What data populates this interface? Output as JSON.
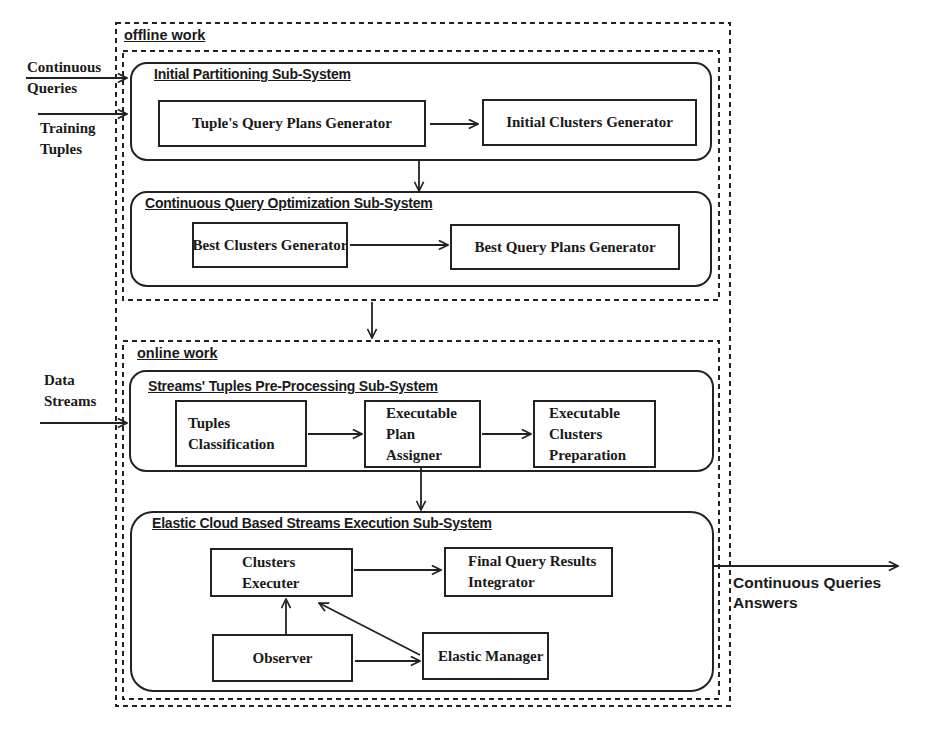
{
  "diagram": {
    "sections": {
      "offline": {
        "label": "offline work"
      },
      "online": {
        "label": "online work"
      }
    },
    "inputs": {
      "continuous_queries": [
        "Continuous",
        "Queries"
      ],
      "training_tuples": [
        "Training",
        "Tuples"
      ],
      "data_streams": [
        "Data",
        "Streams"
      ]
    },
    "output": {
      "lines": [
        "Continuous Queries",
        "Answers"
      ]
    },
    "subsystems": [
      {
        "id": "initial-partitioning",
        "title": "Initial Partitioning Sub-System",
        "components": [
          {
            "id": "tuples-query-plans-generator",
            "lines": [
              "Tuple's Query Plans Generator"
            ]
          },
          {
            "id": "initial-clusters-generator",
            "lines": [
              "Initial Clusters Generator"
            ]
          }
        ]
      },
      {
        "id": "continuous-query-optimization",
        "title": "Continuous Query Optimization Sub-System",
        "components": [
          {
            "id": "best-clusters-generator",
            "lines": [
              "Best Clusters Generator"
            ]
          },
          {
            "id": "best-query-plans-generator",
            "lines": [
              "Best Query Plans Generator"
            ]
          }
        ]
      },
      {
        "id": "streams-preprocessing",
        "title": "Streams' Tuples Pre-Processing Sub-System",
        "components": [
          {
            "id": "tuples-classification",
            "lines": [
              "Tuples",
              "Classification"
            ]
          },
          {
            "id": "executable-plan-assigner",
            "lines": [
              "Executable",
              "Plan",
              "Assigner"
            ]
          },
          {
            "id": "executable-clusters-preparation",
            "lines": [
              "Executable",
              "Clusters",
              "Preparation"
            ]
          }
        ]
      },
      {
        "id": "elastic-cloud-execution",
        "title": "Elastic Cloud Based Streams Execution Sub-System",
        "components": [
          {
            "id": "clusters-executer",
            "lines": [
              "Clusters",
              "Executer"
            ]
          },
          {
            "id": "final-query-results-integrator",
            "lines": [
              "Final Query Results",
              "Integrator"
            ]
          },
          {
            "id": "observer",
            "lines": [
              "Observer"
            ]
          },
          {
            "id": "elastic-manager",
            "lines": [
              "Elastic Manager"
            ]
          }
        ]
      }
    ],
    "edges": [
      {
        "from": "Continuous Queries",
        "to": "Initial Partitioning Sub-System"
      },
      {
        "from": "Training Tuples",
        "to": "Initial Partitioning Sub-System"
      },
      {
        "from": "Tuple's Query Plans Generator",
        "to": "Initial Clusters Generator"
      },
      {
        "from": "Initial Partitioning Sub-System",
        "to": "Continuous Query Optimization Sub-System"
      },
      {
        "from": "Best Clusters Generator",
        "to": "Best Query Plans Generator"
      },
      {
        "from": "offline work",
        "to": "online work"
      },
      {
        "from": "Data Streams",
        "to": "Streams' Tuples Pre-Processing Sub-System"
      },
      {
        "from": "Tuples Classification",
        "to": "Executable Plan Assigner"
      },
      {
        "from": "Executable Plan Assigner",
        "to": "Executable Clusters Preparation"
      },
      {
        "from": "Executable Plan Assigner",
        "to": "Elastic Cloud Based Streams Execution Sub-System"
      },
      {
        "from": "Clusters Executer",
        "to": "Final Query Results Integrator"
      },
      {
        "from": "Observer",
        "to": "Clusters Executer"
      },
      {
        "from": "Observer",
        "to": "Elastic Manager"
      },
      {
        "from": "Elastic Manager",
        "to": "Clusters Executer"
      },
      {
        "from": "Elastic Cloud Based Streams Execution Sub-System",
        "to": "Continuous Queries Answers"
      }
    ],
    "colors": {
      "line": "#222222",
      "text": "#1a1a1a",
      "background": "#ffffff"
    }
  }
}
